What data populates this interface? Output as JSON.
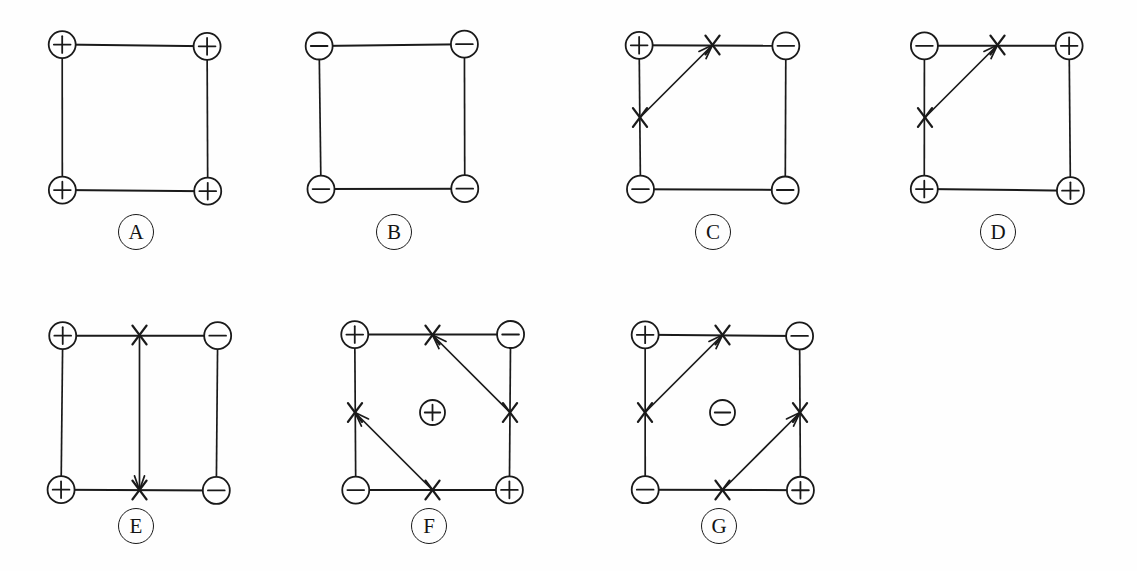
{
  "figure": {
    "background_color": "#fefefe",
    "ink_color": "#1a1a1a",
    "node_symbols": {
      "positive": "+",
      "negative": "−"
    },
    "marker_symbol": "X",
    "rows": 2,
    "columns_top": 4,
    "columns_bottom": 3
  },
  "panels": [
    {
      "id": "A",
      "label": "A",
      "label_x": 118,
      "label_y": 214,
      "square": {
        "x": 62,
        "y": 45,
        "size": 145
      },
      "corners": {
        "top_left": "+",
        "top_right": "+",
        "bottom_left": "+",
        "bottom_right": "+"
      },
      "center_charge": null,
      "arrows": [],
      "x_marks": []
    },
    {
      "id": "B",
      "label": "B",
      "label_x": 376,
      "label_y": 214,
      "square": {
        "x": 320,
        "y": 45,
        "size": 145
      },
      "corners": {
        "top_left": "−",
        "top_right": "−",
        "bottom_left": "−",
        "bottom_right": "−"
      },
      "center_charge": null,
      "arrows": [],
      "x_marks": []
    },
    {
      "id": "C",
      "label": "C",
      "label_x": 695,
      "label_y": 214,
      "square": {
        "x": 640,
        "y": 45,
        "size": 145
      },
      "corners": {
        "top_left": "+",
        "top_right": "−",
        "bottom_left": "−",
        "bottom_right": "−"
      },
      "center_charge": null,
      "arrows": [
        {
          "from": "mid_left",
          "to": "mid_top"
        }
      ],
      "x_marks": [
        "mid_left",
        "mid_top"
      ]
    },
    {
      "id": "D",
      "label": "D",
      "label_x": 980,
      "label_y": 214,
      "square": {
        "x": 925,
        "y": 45,
        "size": 145
      },
      "corners": {
        "top_left": "−",
        "top_right": "+",
        "bottom_left": "+",
        "bottom_right": "+"
      },
      "center_charge": null,
      "arrows": [
        {
          "from": "mid_left",
          "to": "mid_top"
        }
      ],
      "x_marks": [
        "mid_left",
        "mid_top"
      ]
    },
    {
      "id": "E",
      "label": "E",
      "label_x": 118,
      "label_y": 508,
      "square": {
        "x": 62,
        "y": 335,
        "size": 155
      },
      "corners": {
        "top_left": "+",
        "top_right": "−",
        "bottom_left": "+",
        "bottom_right": "−"
      },
      "center_charge": null,
      "arrows": [
        {
          "from": "mid_top",
          "to": "mid_bottom"
        }
      ],
      "x_marks": [
        "mid_top",
        "mid_bottom"
      ]
    },
    {
      "id": "F",
      "label": "F",
      "label_x": 411,
      "label_y": 508,
      "square": {
        "x": 355,
        "y": 335,
        "size": 155
      },
      "corners": {
        "top_left": "+",
        "top_right": "−",
        "bottom_left": "−",
        "bottom_right": "+"
      },
      "center_charge": "+",
      "arrows": [
        {
          "from": "mid_right",
          "to": "mid_top"
        },
        {
          "from": "mid_bottom",
          "to": "mid_left"
        }
      ],
      "x_marks": [
        "mid_top",
        "mid_right",
        "mid_bottom",
        "mid_left"
      ]
    },
    {
      "id": "G",
      "label": "G",
      "label_x": 701,
      "label_y": 508,
      "square": {
        "x": 645,
        "y": 335,
        "size": 155
      },
      "corners": {
        "top_left": "+",
        "top_right": "−",
        "bottom_left": "−",
        "bottom_right": "+"
      },
      "center_charge": "−",
      "arrows": [
        {
          "from": "mid_left",
          "to": "mid_top"
        },
        {
          "from": "mid_bottom",
          "to": "mid_right"
        }
      ],
      "x_marks": [
        "mid_top",
        "mid_right",
        "mid_bottom",
        "mid_left"
      ]
    }
  ]
}
